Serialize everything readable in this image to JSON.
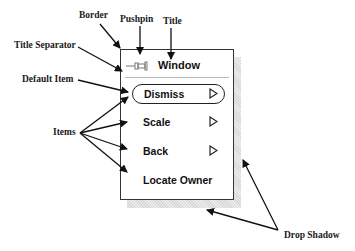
{
  "window": {
    "title": "Window",
    "items": [
      {
        "label": "Dismiss",
        "default": true,
        "submenu": true
      },
      {
        "label": "Scale",
        "default": false,
        "submenu": true
      },
      {
        "label": "Back",
        "default": false,
        "submenu": true
      },
      {
        "label": "Locate Owner",
        "default": false,
        "submenu": false
      }
    ]
  },
  "callouts": {
    "border": "Border",
    "pushpin": "Pushpin",
    "title": "Title",
    "title_separator": "Title Separator",
    "default_item": "Default Item",
    "items": "Items",
    "drop_shadow": "Drop Shadow"
  },
  "icons": {
    "pushpin": "pushpin-icon",
    "submenu": "submenu-triangle-icon"
  }
}
